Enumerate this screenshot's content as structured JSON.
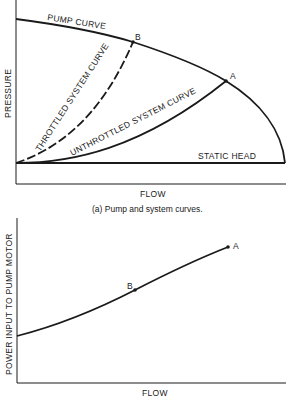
{
  "colors": {
    "ink": "#1a1a1a",
    "background": "#ffffff"
  },
  "top_chart": {
    "y_axis_label": "PRESSURE",
    "x_axis_label": "FLOW",
    "curves": {
      "pump": "PUMP CURVE",
      "throttled": "THROTTLED SYSTEM CURVE",
      "unthrottled": "UNTHROTTLED SYSTEM CURVE",
      "static": "STATIC HEAD"
    },
    "points": {
      "a": "A",
      "b": "B"
    },
    "caption": "(a)  Pump and system curves."
  },
  "bottom_chart": {
    "y_axis_label": "POWER INPUT TO PUMP MOTOR",
    "x_axis_label": "FLOW",
    "points": {
      "a": "A",
      "b": "B"
    }
  }
}
